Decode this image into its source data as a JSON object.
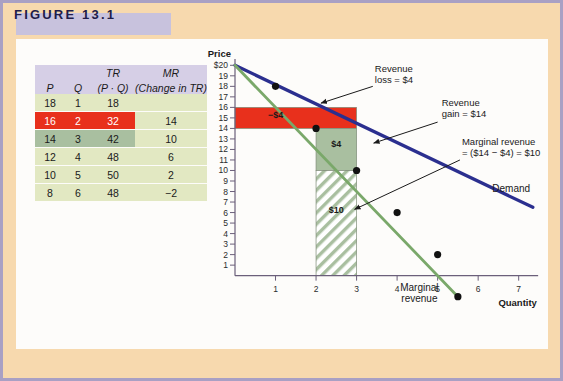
{
  "figure": {
    "title": "FIGURE 13.1",
    "frame_color": "#a9a0c4",
    "band_color": "#c8c2dd",
    "background_color": "#f7d9ae",
    "panel_color": "#fdfcfa"
  },
  "table": {
    "header_row_1": [
      "",
      "",
      "TR",
      "MR"
    ],
    "header_row_2": [
      "P",
      "Q",
      "(P · Q)",
      "(Change in TR)"
    ],
    "rows": [
      {
        "p": "18",
        "q": "1",
        "tr": "18",
        "mr": "",
        "highlight": "none"
      },
      {
        "p": "16",
        "q": "2",
        "tr": "32",
        "mr": "14",
        "highlight": "red"
      },
      {
        "p": "14",
        "q": "3",
        "tr": "42",
        "mr": "10",
        "highlight": "green"
      },
      {
        "p": "12",
        "q": "4",
        "tr": "48",
        "mr": "6",
        "highlight": "none"
      },
      {
        "p": "10",
        "q": "5",
        "tr": "50",
        "mr": "2",
        "highlight": "none"
      },
      {
        "p": "8",
        "q": "6",
        "tr": "48",
        "mr": "−2",
        "highlight": "none"
      }
    ],
    "header_bg": "#d6cfe6",
    "row_bg": "#e2e8c2",
    "red_bg": "#e8301c",
    "green_bg": "#a9bfa0"
  },
  "chart_data": {
    "type": "line",
    "title": "",
    "xlabel": "Quantity",
    "ylabel": "Price",
    "xlim": [
      0,
      7.6
    ],
    "ylim": [
      -2.6,
      20.6
    ],
    "xticks": [
      1,
      2,
      3,
      4,
      5,
      6,
      7
    ],
    "yticks": [
      1,
      2,
      3,
      4,
      5,
      6,
      7,
      8,
      9,
      10,
      11,
      12,
      13,
      14,
      15,
      16,
      17,
      18,
      19,
      20
    ],
    "ytick_labels": [
      "1",
      "2",
      "3",
      "4",
      "5",
      "6",
      "7",
      "8",
      "9",
      "10",
      "11",
      "12",
      "13",
      "14",
      "15",
      "16",
      "17",
      "18",
      "19",
      "$20"
    ],
    "grid": false,
    "legend": "none",
    "series": [
      {
        "name": "Demand",
        "color": "#2b2f8f",
        "x": [
          0,
          7.35
        ],
        "values": [
          20,
          6.5
        ],
        "points": []
      },
      {
        "name": "Marginal revenue",
        "color": "#7aa86a",
        "x": [
          0,
          5.5
        ],
        "values": [
          20,
          -2
        ],
        "points": [
          {
            "x": 1,
            "y": 18
          },
          {
            "x": 2,
            "y": 14
          },
          {
            "x": 3,
            "y": 10
          },
          {
            "x": 4,
            "y": 6
          },
          {
            "x": 5,
            "y": 2
          },
          {
            "x": 5.5,
            "y": -2
          }
        ]
      }
    ],
    "regions": [
      {
        "name": "revenue-loss",
        "label": "−$4",
        "x0": 0,
        "x1": 3,
        "y0": 14,
        "y1": 16,
        "fill": "#e8301c",
        "label_color": "#1a1a1a",
        "label_x": 1.0,
        "label_y": 15
      },
      {
        "name": "revenue-gain-upper",
        "label": "$4",
        "x0": 2,
        "x1": 3,
        "y0": 10,
        "y1": 14,
        "fill": "#a9bfa0",
        "label_color": "#1a1a1a",
        "label_x": 2.5,
        "label_y": 12.2
      },
      {
        "name": "revenue-gain-hatched",
        "label": "$10",
        "x0": 2,
        "x1": 3,
        "y0": 0,
        "y1": 10,
        "fill": "hatch",
        "label_color": "#1a1a1a",
        "label_x": 2.5,
        "label_y": 6
      }
    ],
    "annotations": [
      {
        "name": "revenue-loss-annotation",
        "lines": [
          "Revenue",
          "loss = $4"
        ],
        "text_x": 3.45,
        "text_y": 19.4,
        "arrow_from": [
          3.4,
          18.0
        ],
        "arrow_to": [
          2.12,
          16.4
        ]
      },
      {
        "name": "revenue-gain-annotation",
        "lines": [
          "Revenue",
          "gain = $14"
        ],
        "text_x": 5.1,
        "text_y": 16.1,
        "arrow_from": [
          5.0,
          14.6
        ],
        "arrow_to": [
          3.42,
          12.6
        ]
      },
      {
        "name": "marginal-revenue-annotation",
        "lines": [
          "Marginal revenue",
          "= ($14 − $4) = $10"
        ],
        "text_x": 5.6,
        "text_y": 12.4,
        "arrow_from": [
          5.55,
          11.0
        ],
        "arrow_to": [
          2.95,
          6.3
        ]
      }
    ],
    "curve_labels": [
      {
        "name": "demand-label",
        "text": "Demand",
        "x": 6.35,
        "y": 8.0
      },
      {
        "name": "marginal-revenue-label",
        "lines": [
          "Marginal",
          "revenue"
        ],
        "x": 4.55,
        "y": -1.5
      }
    ]
  }
}
